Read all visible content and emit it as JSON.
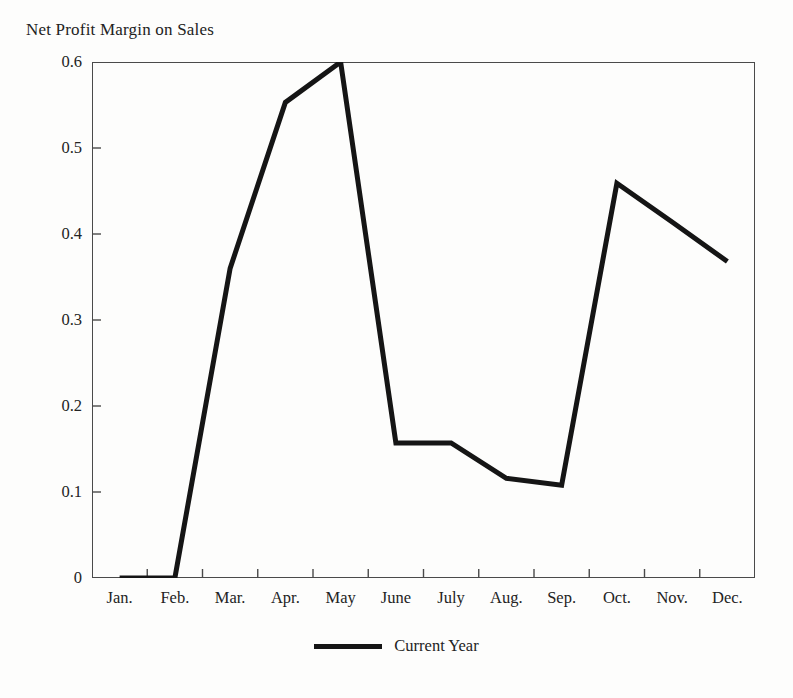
{
  "chart_data": {
    "type": "line",
    "title": "Net Profit Margin on Sales",
    "xlabel": "",
    "ylabel": "",
    "categories": [
      "Jan.",
      "Feb.",
      "Mar.",
      "Apr.",
      "May",
      "June",
      "July",
      "Aug.",
      "Sep.",
      "Oct.",
      "Nov.",
      "Dec."
    ],
    "series": [
      {
        "name": "Current Year",
        "color": "#151515",
        "values": [
          0,
          0,
          0.36,
          0.553,
          0.6,
          0.157,
          0.157,
          0.116,
          0.108,
          0.459,
          0.414,
          0.368
        ]
      }
    ],
    "ylim": [
      0,
      0.6
    ],
    "yticks": [
      0,
      0.1,
      0.2,
      0.3,
      0.4,
      0.5,
      0.6
    ],
    "ytick_labels": [
      "0",
      "0.1",
      "0.2",
      "0.3",
      "0.4",
      "0.5",
      "0.6"
    ],
    "grid": false,
    "legend_position": "bottom-center",
    "frame": "box",
    "tick_direction": "in"
  },
  "legend": {
    "entries": [
      {
        "label": "Current Year",
        "swatch": "line-swatch"
      }
    ]
  },
  "colors": {
    "line": "#151515",
    "frame": "#4a4a4a",
    "text": "#232323",
    "background": "#fdfdfc"
  }
}
